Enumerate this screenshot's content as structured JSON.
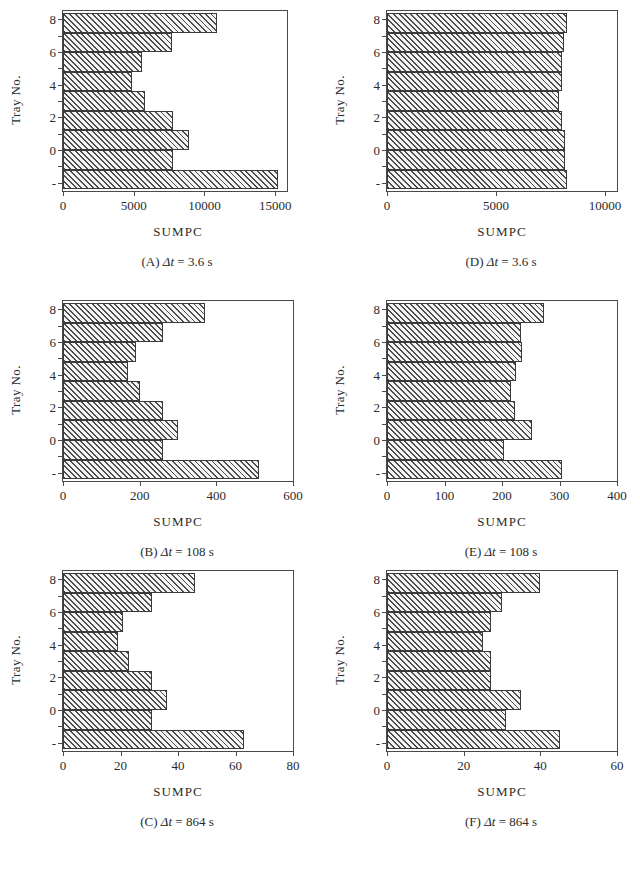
{
  "figure": {
    "y_axis_title": "Tray No.",
    "x_axis_title": "SUMPC",
    "tray_labels_top_down": [
      "8",
      "",
      "6",
      "",
      "4",
      "",
      "2",
      "",
      "0",
      "",
      "-"
    ]
  },
  "chart_data": [
    {
      "id": "A",
      "type": "bar",
      "orientation": "horizontal",
      "title": "",
      "caption": "(A)  Δt = 3.6 s",
      "caption_prefix": "(A)",
      "caption_symbol": "Δt",
      "caption_value": "= 3.6 s",
      "xlabel": "SUMPC",
      "ylabel": "Tray No.",
      "xlim": [
        0,
        15833
      ],
      "xticks": [
        0,
        5000,
        10000,
        15000
      ],
      "xtick_labels": [
        "0",
        "5000",
        "10000",
        "15000"
      ],
      "categories": [
        "8",
        "7",
        "6",
        "5",
        "4",
        "3",
        "2",
        "1",
        "0"
      ],
      "values": [
        10900,
        7700,
        5600,
        4900,
        5800,
        7800,
        8900,
        7800,
        15200
      ],
      "grid": false,
      "legend": "none"
    },
    {
      "id": "D",
      "type": "bar",
      "orientation": "horizontal",
      "title": "",
      "caption": "(D)  Δt = 3.6 s",
      "caption_prefix": "(D)",
      "caption_symbol": "Δt",
      "caption_value": "= 3.6 s",
      "xlabel": "SUMPC",
      "ylabel": "Tray No.",
      "xlim": [
        0,
        10555
      ],
      "xticks": [
        0,
        5000,
        10000
      ],
      "xtick_labels": [
        "0",
        "5000",
        "10000"
      ],
      "categories": [
        "8",
        "7",
        "6",
        "5",
        "4",
        "3",
        "2",
        "1",
        "0"
      ],
      "values": [
        8250,
        8100,
        8050,
        8050,
        7900,
        8050,
        8150,
        8150,
        8250
      ],
      "grid": false,
      "legend": "none"
    },
    {
      "id": "B",
      "type": "bar",
      "orientation": "horizontal",
      "title": "",
      "caption": "(B)  Δt = 108 s",
      "caption_prefix": "(B)",
      "caption_symbol": "Δt",
      "caption_value": "= 108 s",
      "xlabel": "SUMPC",
      "ylabel": "Tray No.",
      "xlim": [
        0,
        600
      ],
      "xticks": [
        0,
        200,
        400,
        600
      ],
      "xtick_labels": [
        "0",
        "200",
        "400",
        "600"
      ],
      "categories": [
        "8",
        "7",
        "6",
        "5",
        "4",
        "3",
        "2",
        "1",
        "0"
      ],
      "values": [
        370,
        260,
        190,
        170,
        200,
        260,
        300,
        260,
        510
      ],
      "grid": false,
      "legend": "none"
    },
    {
      "id": "E",
      "type": "bar",
      "orientation": "horizontal",
      "title": "",
      "caption": "(E)  Δt = 108 s",
      "caption_prefix": "(E)",
      "caption_symbol": "Δt",
      "caption_value": "= 108 s",
      "xlabel": "SUMPC",
      "ylabel": "Tray No.",
      "xlim": [
        0,
        400
      ],
      "xticks": [
        0,
        100,
        200,
        300,
        400
      ],
      "xtick_labels": [
        "0",
        "100",
        "200",
        "300",
        "400"
      ],
      "categories": [
        "8",
        "7",
        "6",
        "5",
        "4",
        "3",
        "2",
        "1",
        "0"
      ],
      "values": [
        273,
        233,
        234,
        225,
        215,
        223,
        253,
        203,
        305
      ],
      "grid": false,
      "legend": "none"
    },
    {
      "id": "C",
      "type": "bar",
      "orientation": "horizontal",
      "title": "",
      "caption": "(C)  Δt = 864 s",
      "caption_prefix": "(C)",
      "caption_symbol": "Δt",
      "caption_value": "= 864 s",
      "xlabel": "SUMPC",
      "ylabel": "Tray No.",
      "xlim": [
        0,
        80
      ],
      "xticks": [
        0,
        20,
        40,
        60,
        80
      ],
      "xtick_labels": [
        "0",
        "20",
        "40",
        "60",
        "80"
      ],
      "categories": [
        "8",
        "7",
        "6",
        "5",
        "4",
        "3",
        "2",
        "1",
        "0"
      ],
      "values": [
        46,
        31,
        21,
        19,
        23,
        31,
        36,
        31,
        63
      ],
      "grid": false,
      "legend": "none"
    },
    {
      "id": "F",
      "type": "bar",
      "orientation": "horizontal",
      "title": "",
      "caption": "(F)  Δt = 864 s",
      "caption_prefix": "(F)",
      "caption_symbol": "Δt",
      "caption_value": "= 864 s",
      "xlabel": "SUMPC",
      "ylabel": "Tray No.",
      "xlim": [
        0,
        60
      ],
      "xticks": [
        0,
        20,
        40,
        60
      ],
      "xtick_labels": [
        "0",
        "20",
        "40",
        "60"
      ],
      "categories": [
        "8",
        "7",
        "6",
        "5",
        "4",
        "3",
        "2",
        "1",
        "0"
      ],
      "values": [
        40,
        30,
        27,
        25,
        27,
        27,
        35,
        31,
        45
      ],
      "grid": false,
      "legend": "none"
    }
  ]
}
